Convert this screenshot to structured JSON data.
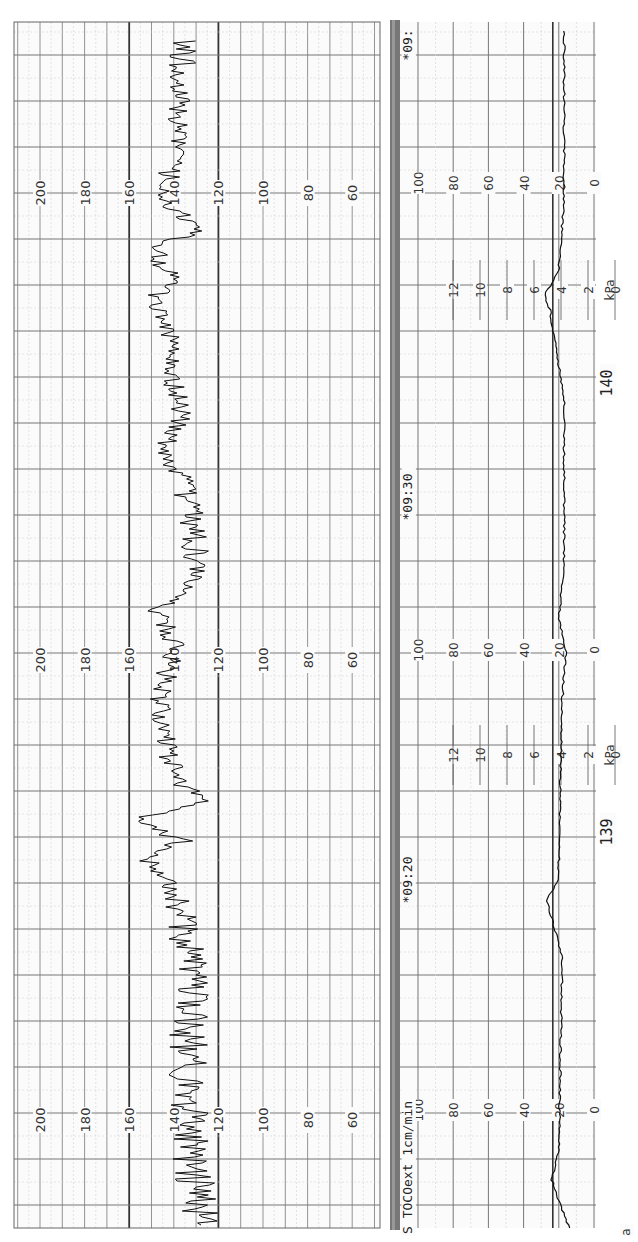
{
  "chart_data": [
    {
      "type": "line",
      "title": "Fetal Heart Rate (FHR)",
      "orientation": "rotated 90deg clockwise (time runs bottom-to-top)",
      "ylabel": "bpm",
      "ylim": [
        50,
        210
      ],
      "scale_ticks": [
        200,
        180,
        160,
        140,
        120,
        100,
        80,
        60
      ],
      "scale_label_rows": 3,
      "reference_lines": [
        160,
        120
      ],
      "grid": true,
      "segments_approx": [
        {
          "time": "before 09:20",
          "baseline_bpm": 130,
          "variability": "marked, ~120-145"
        },
        {
          "time": "09:20-09:25",
          "baseline_bpm": 135,
          "notes": "accelerations to ~155-160"
        },
        {
          "time": "09:25-09:30",
          "baseline_bpm": 138,
          "notes": "spikes 150-160, artifact near 80"
        },
        {
          "time": "09:30-09:35",
          "baseline_bpm": 140,
          "notes": "swings 125-158"
        },
        {
          "time": "09:35-09:40",
          "baseline_bpm": 138,
          "notes": "variability 125-160"
        },
        {
          "time": "after 09:40",
          "baseline_bpm": 140,
          "notes": "variability 130-150"
        }
      ]
    },
    {
      "type": "line",
      "title": "Uterine Activity (TOCOext)",
      "ylabel": "TOCO units / kPa",
      "ylim": [
        0,
        100
      ],
      "scale_ticks": [
        100,
        80,
        60,
        40,
        20,
        0
      ],
      "kpa_ticks": [
        12,
        10,
        8,
        6,
        4,
        2,
        0
      ],
      "kpa_unit": "kPa",
      "baseline": 20,
      "notes": "Flat around 15-20 with small contractions ~25 near 09:20 and after 09:35"
    }
  ],
  "header": {
    "mode_label": "TOCOext",
    "paper_speed": "1cm/min",
    "prefix_char": "S"
  },
  "time_marks": [
    "*09:20",
    "*09:30",
    "*09:"
  ],
  "page_numbers": [
    "139",
    "140"
  ],
  "fhr_scale": [
    "200",
    "180",
    "160",
    "140",
    "120",
    "100",
    "80",
    "60"
  ],
  "toco_scale": [
    "100",
    "80",
    "60",
    "40",
    "20",
    "0"
  ],
  "kpa_scale": [
    "12",
    "10",
    "8",
    "6",
    "4",
    "2",
    "0"
  ],
  "kpa_unit": "kPa",
  "misc_edge_char": "a"
}
